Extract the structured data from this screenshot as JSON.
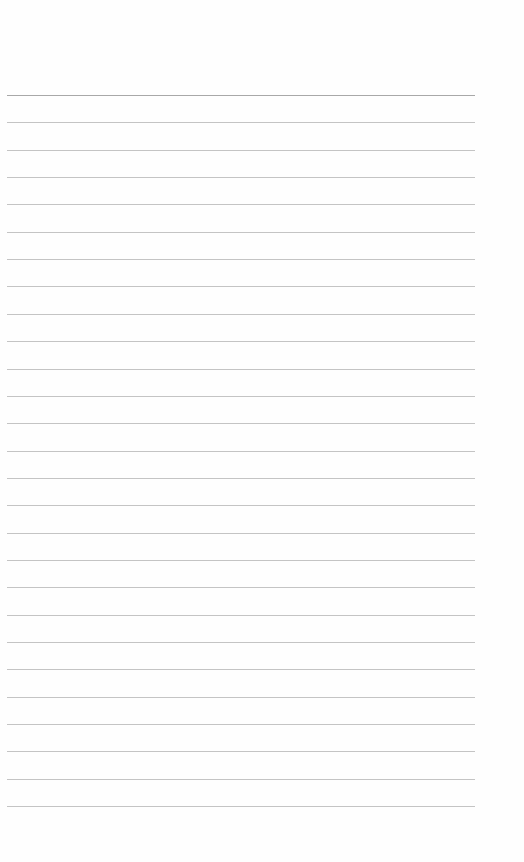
{
  "page": {
    "type": "lined-paper",
    "background_color": "#fefefe",
    "rule_color": "#c4c4c4",
    "first_rule_color": "#a8a8a8",
    "rule_count": 27,
    "first_rule_y": 95,
    "rule_spacing": 27.35,
    "rule_left": 7,
    "rule_right": 475
  }
}
